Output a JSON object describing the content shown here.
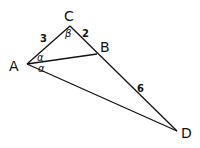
{
  "diagram": {
    "type": "geometry-triangle",
    "points": {
      "A": {
        "label": "A",
        "x": 27,
        "y": 64
      },
      "B": {
        "label": "B",
        "x": 97,
        "y": 54
      },
      "C": {
        "label": "C",
        "x": 70,
        "y": 26
      },
      "D": {
        "label": "D",
        "x": 177,
        "y": 131
      }
    },
    "segments": [
      {
        "from": "A",
        "to": "C"
      },
      {
        "from": "C",
        "to": "D"
      },
      {
        "from": "A",
        "to": "B"
      },
      {
        "from": "A",
        "to": "D"
      }
    ],
    "side_labels": {
      "AC": "3",
      "CB": "2",
      "BD": "6"
    },
    "angle_labels": {
      "C": "β",
      "A_upper": "α",
      "A_lower": "α"
    },
    "stroke_color": "#111111"
  }
}
